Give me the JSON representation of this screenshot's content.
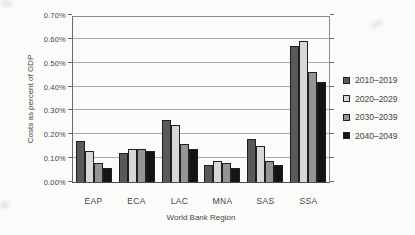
{
  "chart_data": {
    "type": "bar",
    "title": "",
    "xlabel": "World Bank Region",
    "ylabel": "Costs as percent of GDP",
    "categories": [
      "EAP",
      "ECA",
      "LAC",
      "MNA",
      "SAS",
      "SSA"
    ],
    "series": [
      {
        "name": "2010–2019",
        "color": "#58595b",
        "values": [
          0.17,
          0.12,
          0.26,
          0.07,
          0.18,
          0.57
        ]
      },
      {
        "name": "2020–2029",
        "color": "#d7d8d9",
        "values": [
          0.13,
          0.14,
          0.24,
          0.09,
          0.15,
          0.59
        ]
      },
      {
        "name": "2030–2039",
        "color": "#929497",
        "values": [
          0.08,
          0.14,
          0.16,
          0.08,
          0.09,
          0.46
        ]
      },
      {
        "name": "2040–2049",
        "color": "#141414",
        "values": [
          0.06,
          0.13,
          0.14,
          0.06,
          0.07,
          0.42
        ]
      }
    ],
    "ylim": [
      0,
      0.7
    ],
    "ytick_step": 0.1,
    "ytick_labels": [
      "0.00%",
      "0.10%",
      "0.20%",
      "0.30%",
      "0.40%",
      "0.50%",
      "0.60%",
      "0.70%"
    ],
    "grid": true,
    "legend_position": "right"
  },
  "style": {
    "background": "#fbfbfa",
    "gridline_color": "#a9a9a9",
    "bar_border_color": "#1f1f1f",
    "text_color": "#454545"
  }
}
